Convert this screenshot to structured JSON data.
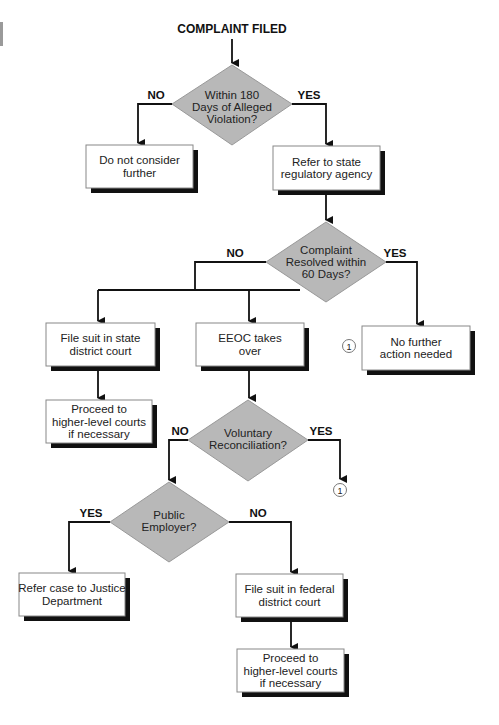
{
  "title": "COMPLAINT FILED",
  "colors": {
    "diamond_fill": "#b8b8b8",
    "diamond_stroke": "#999999",
    "box_fill": "#ffffff",
    "box_stroke": "#888888",
    "shadow": "#111111",
    "line": "#111111"
  },
  "decisions": {
    "within_180": {
      "lines": [
        "Within 180",
        "Days of Alleged",
        "Violation?"
      ],
      "no_label": "NO",
      "yes_label": "YES"
    },
    "resolved_60": {
      "lines": [
        "Complaint",
        "Resolved within",
        "60 Days?"
      ],
      "no_label": "NO",
      "yes_label": "YES"
    },
    "voluntary": {
      "lines": [
        "Voluntary",
        "Reconciliation?"
      ],
      "no_label": "NO",
      "yes_label": "YES"
    },
    "public_employer": {
      "lines": [
        "Public",
        "Employer?"
      ],
      "yes_label": "YES",
      "no_label": "NO"
    }
  },
  "boxes": {
    "do_not_consider": [
      "Do not consider",
      "further"
    ],
    "refer_state": [
      "Refer to state",
      "regulatory agency"
    ],
    "state_court": [
      "File suit in state",
      "district court"
    ],
    "eeoc": [
      "EEOC takes",
      "over"
    ],
    "no_further": [
      "No further",
      "action needed"
    ],
    "higher_courts_state": [
      "Proceed  to",
      "higher-level courts",
      "if necessary"
    ],
    "justice_dept": [
      "Refer case to Justice",
      "Department"
    ],
    "federal_court": [
      "File suit in federal",
      "district court"
    ],
    "higher_courts_federal": [
      "Proceed to",
      "higher-level courts",
      "if necessary"
    ]
  },
  "connectors": {
    "one_a": "1",
    "one_b": "1"
  }
}
